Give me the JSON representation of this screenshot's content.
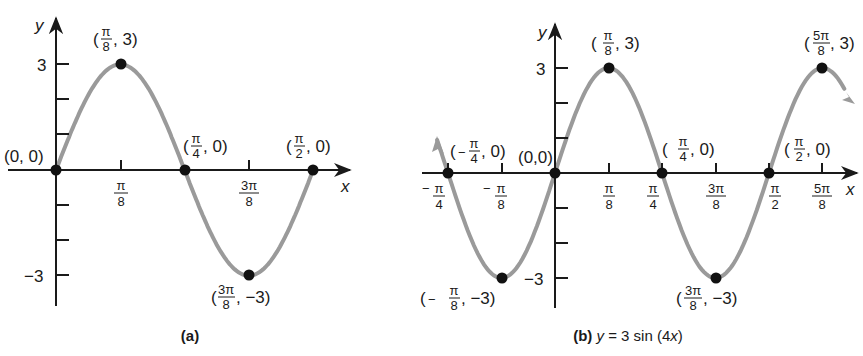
{
  "chart_data": [
    {
      "id": "a",
      "type": "line",
      "caption": "(a)",
      "function": "y = 3 sin(4x)",
      "domain": [
        "0",
        "π/2"
      ],
      "xlabel": "x",
      "ylabel": "y",
      "ylim": [
        -3,
        3
      ],
      "x_tick_labels": [
        "π/8",
        "3π/8"
      ],
      "y_tick_labels": [
        "3",
        "−3"
      ],
      "y_ticks_minor": [
        1,
        2,
        -1,
        -2
      ],
      "grid": false,
      "points": [
        {
          "x": 0,
          "x_label": "0",
          "y": 0,
          "label": "(0, 0)"
        },
        {
          "x": 0.3927,
          "x_label": "π/8",
          "y": 3,
          "label": "(π/8, 3)"
        },
        {
          "x": 0.7854,
          "x_label": "π/4",
          "y": 0,
          "label": "(π/4, 0)"
        },
        {
          "x": 1.1781,
          "x_label": "3π/8",
          "y": -3,
          "label": "(3π/8, −3)"
        },
        {
          "x": 1.5708,
          "x_label": "π/2",
          "y": 0,
          "label": "(π/2, 0)"
        }
      ]
    },
    {
      "id": "b",
      "type": "line",
      "caption": "(b) y = 3 sin (4x)",
      "caption_parts": {
        "tag": "(b)",
        "eq_y": "y",
        "eq_mid": " = 3 sin (4",
        "eq_x": "x",
        "eq_end": ")"
      },
      "function": "y = 3 sin(4x)",
      "domain": [
        "<−π/4",
        ">5π/8"
      ],
      "xlabel": "x",
      "ylabel": "y",
      "ylim": [
        -3,
        3
      ],
      "x_tick_labels": [
        "−π/4",
        "−π/8",
        "π/8",
        "π/4",
        "3π/8",
        "π/2",
        "5π/8"
      ],
      "y_tick_labels": [
        "3",
        "−3"
      ],
      "y_ticks_minor": [
        1,
        2,
        -1,
        -2
      ],
      "grid": false,
      "points": [
        {
          "x": -0.7854,
          "x_label": "−π/4",
          "y": 0,
          "label": "(−π/4, 0)"
        },
        {
          "x": -0.3927,
          "x_label": "−π/8",
          "y": -3,
          "label": "(−π/8, −3)"
        },
        {
          "x": 0,
          "x_label": "0",
          "y": 0,
          "label": "(0,0)"
        },
        {
          "x": 0.3927,
          "x_label": "π/8",
          "y": 3,
          "label": "(π/8, 3)"
        },
        {
          "x": 0.7854,
          "x_label": "π/4",
          "y": 0,
          "label": "(π/4, 0)"
        },
        {
          "x": 1.1781,
          "x_label": "3π/8",
          "y": -3,
          "label": "(3π/8, −3)"
        },
        {
          "x": 1.5708,
          "x_label": "π/2",
          "y": 0,
          "label": "(π/2, 0)"
        },
        {
          "x": 1.9635,
          "x_label": "5π/8",
          "y": 3,
          "label": "(5π/8, 3)"
        }
      ]
    }
  ],
  "labels": {
    "pi": "π",
    "eight": "8",
    "four": "4",
    "two": "2",
    "three": "3",
    "neg_three": "−3",
    "neg": "−",
    "five": "5",
    "zero": "0",
    "x": "x",
    "y": "y",
    "open": "(",
    "close": ")",
    "comma3": ", 3)",
    "comma0": ", 0)",
    "commaNeg3": ", −3)",
    "origin_a": "(0, 0)",
    "origin_b": "(0,0)",
    "cap_a": "(a)"
  },
  "style": {
    "curve_color": "#9a9a9a",
    "axis_color": "#1a1a1a",
    "point_color": "#111111"
  }
}
